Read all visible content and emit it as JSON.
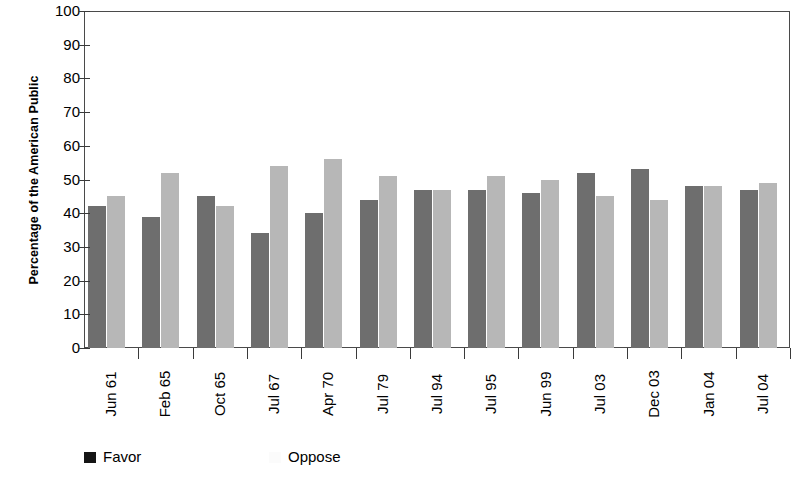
{
  "chart_data": {
    "type": "bar",
    "title": "",
    "xlabel": "",
    "ylabel": "Percentage of the American Public",
    "ylim": [
      0,
      100
    ],
    "ytick_step": 10,
    "yticks": [
      0,
      10,
      20,
      30,
      40,
      50,
      60,
      70,
      80,
      90,
      100
    ],
    "grid": false,
    "legend_position": "bottom-left",
    "categories": [
      "Jun 61",
      "Feb 65",
      "Oct 65",
      "Jul 67",
      "Apr 70",
      "Jul 79",
      "Jul 94",
      "Jul 95",
      "Jun 99",
      "Jul 03",
      "Dec 03",
      "Jan 04",
      "Jul 04"
    ],
    "series": [
      {
        "name": "Favor",
        "color": "#6e6e6e",
        "values": [
          42,
          39,
          45,
          34,
          40,
          44,
          47,
          47,
          46,
          52,
          53,
          48,
          47
        ]
      },
      {
        "name": "Oppose",
        "color": "#b7b7b7",
        "values": [
          45,
          52,
          42,
          54,
          56,
          51,
          47,
          51,
          50,
          45,
          44,
          48,
          49
        ]
      }
    ]
  },
  "legend": {
    "items": [
      {
        "label": "Favor",
        "swatch": "legend-swatch-favor"
      },
      {
        "label": "Oppose",
        "swatch": "legend-swatch-oppose"
      }
    ]
  }
}
